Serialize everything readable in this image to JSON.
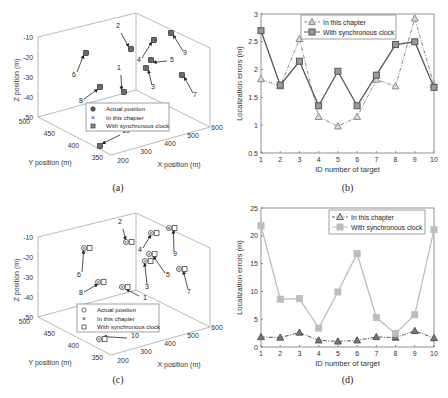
{
  "chart_data": [
    {
      "panel": "a",
      "type": "scatter",
      "title": "",
      "caption": "(a)",
      "xlabel": "X position (m)",
      "ylabel": "Y position (m)",
      "zlabel": "Z position (m)",
      "xticks": [
        "200",
        "300",
        "400",
        "500",
        "600"
      ],
      "yticks": [
        "350",
        "400",
        "450",
        "500"
      ],
      "zticks": [
        "-10",
        "-20",
        "-30",
        "-40",
        "-50"
      ],
      "xlim": [
        200,
        600
      ],
      "ylim": [
        350,
        500
      ],
      "zlim": [
        -50,
        -10
      ],
      "legend": [
        "Actual position",
        "In this chapter",
        "With synchronous clock"
      ],
      "legend_position": "inside-bottom",
      "target_labels": [
        "1",
        "2",
        "3",
        "4",
        "5",
        "6",
        "7",
        "8",
        "9",
        "10"
      ]
    },
    {
      "panel": "b",
      "type": "line",
      "title": "",
      "caption": "(b)",
      "xlabel": "ID number of target",
      "ylabel": "Localization errors (m)",
      "categories": [
        1,
        2,
        3,
        4,
        5,
        6,
        7,
        8,
        9,
        10
      ],
      "xticks": [
        "1",
        "2",
        "3",
        "4",
        "5",
        "6",
        "7",
        "8",
        "9",
        "10"
      ],
      "yticks": [
        "0.5",
        "1",
        "1.5",
        "2",
        "2.5",
        "3"
      ],
      "ylim": [
        0.5,
        3
      ],
      "legend_position": "top-center",
      "grid": false,
      "series": [
        {
          "name": "In this chapter",
          "marker": "triangle",
          "style": "dash-dot",
          "color": "#8a8a8a",
          "values": [
            1.83,
            1.7,
            2.55,
            1.15,
            0.98,
            1.15,
            1.82,
            1.7,
            2.92,
            1.72
          ]
        },
        {
          "name": "With synchronous clock",
          "marker": "square",
          "style": "solid",
          "color": "#555555",
          "values": [
            2.7,
            1.72,
            2.15,
            1.35,
            1.97,
            1.35,
            1.9,
            2.45,
            2.5,
            1.68
          ]
        }
      ]
    },
    {
      "panel": "c",
      "type": "scatter",
      "title": "",
      "caption": "(c)",
      "xlabel": "X position (m)",
      "ylabel": "Y position (m)",
      "zlabel": "Z position (m)",
      "xticks": [
        "200",
        "300",
        "400",
        "500",
        "600"
      ],
      "yticks": [
        "350",
        "400",
        "450",
        "500"
      ],
      "zticks": [
        "-10",
        "-20",
        "-30",
        "-40",
        "-50"
      ],
      "xlim": [
        200,
        600
      ],
      "ylim": [
        350,
        500
      ],
      "zlim": [
        -50,
        -10
      ],
      "legend": [
        "Actual position",
        "In this chapter",
        "With synchronous clock"
      ],
      "legend_position": "inside-bottom",
      "target_labels": [
        "1",
        "2",
        "3",
        "4",
        "5",
        "6",
        "7",
        "8",
        "9",
        "10"
      ]
    },
    {
      "panel": "d",
      "type": "line",
      "title": "",
      "caption": "(d)",
      "xlabel": "ID number of target",
      "ylabel": "Localization errors (m)",
      "categories": [
        1,
        2,
        3,
        4,
        5,
        6,
        7,
        8,
        9,
        10
      ],
      "xticks": [
        "1",
        "2",
        "3",
        "4",
        "5",
        "6",
        "7",
        "8",
        "9",
        "10"
      ],
      "yticks": [
        "0",
        "5",
        "10",
        "15",
        "20",
        "25"
      ],
      "ylim": [
        0,
        25
      ],
      "legend_position": "top-right",
      "grid": false,
      "series": [
        {
          "name": "In this chapter",
          "marker": "triangle",
          "style": "dash-dot",
          "color": "#555555",
          "values": [
            1.8,
            1.7,
            2.6,
            1.2,
            1.0,
            1.2,
            1.8,
            1.7,
            2.9,
            1.6
          ]
        },
        {
          "name": "With synchronous clock",
          "marker": "square",
          "style": "solid",
          "color": "#bdbdbd",
          "values": [
            21.8,
            8.6,
            8.7,
            3.4,
            9.9,
            16.8,
            5.3,
            2.4,
            5.8,
            21.1
          ]
        }
      ]
    }
  ],
  "panels": {
    "a": {
      "caption": "(a)"
    },
    "b": {
      "caption": "(b)"
    },
    "c": {
      "caption": "(c)"
    },
    "d": {
      "caption": "(d)"
    }
  }
}
